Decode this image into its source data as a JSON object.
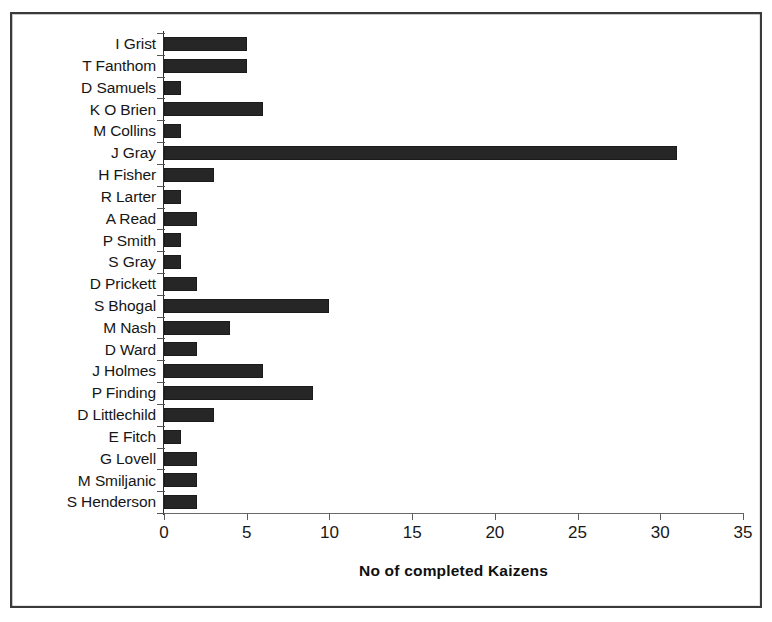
{
  "chart_data": {
    "type": "bar",
    "orientation": "horizontal",
    "title": "",
    "xlabel": "No of completed Kaizens",
    "ylabel": "",
    "xlim": [
      0,
      35
    ],
    "xticks": [
      0,
      5,
      10,
      15,
      20,
      25,
      30,
      35
    ],
    "grid": false,
    "legend": false,
    "bar_color": "#262626",
    "axis_color": "#2b2b2b",
    "categories": [
      "I Grist",
      "T Fanthom",
      "D Samuels",
      "K O Brien",
      "M Collins",
      "J Gray",
      "H Fisher",
      "R Larter",
      "A Read",
      "P Smith",
      "S Gray",
      "D Prickett",
      "S Bhogal",
      "M Nash",
      "D Ward",
      "J Holmes",
      "P Finding",
      "D Littlechild",
      "E Fitch",
      "G Lovell",
      "M Smiljanic",
      "S Henderson"
    ],
    "values": [
      5,
      5,
      1,
      6,
      1,
      31,
      3,
      1,
      2,
      1,
      1,
      2,
      10,
      4,
      2,
      6,
      9,
      3,
      1,
      2,
      2,
      2
    ]
  }
}
